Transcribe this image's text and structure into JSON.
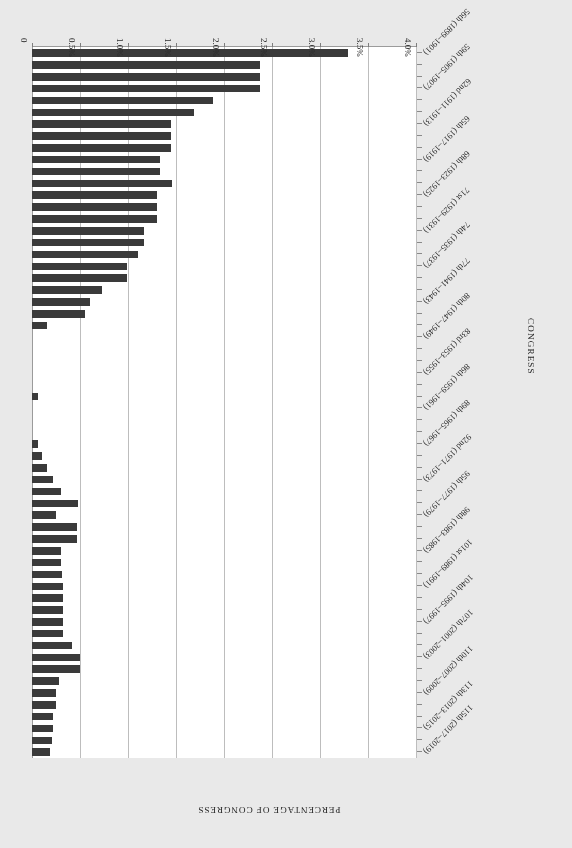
{
  "chart_data": {
    "type": "bar",
    "orientation": "horizontal",
    "title": "",
    "xlabel": "PERCENTAGE OF CONGRESS",
    "ylabel": "CONGRESS",
    "grid": true,
    "legend": false,
    "rotated_180": true,
    "xlim": [
      0,
      4.0
    ],
    "xticks": [
      0,
      0.5,
      1.0,
      1.5,
      2.0,
      2.5,
      3.0,
      3.5,
      4.0
    ],
    "xtick_labels": [
      "0",
      "0.5%",
      "1.0%",
      "1.5%",
      "2.0%",
      "2.5%",
      "3.0%",
      "3.5%",
      "4.0%"
    ],
    "value_suffix": "%",
    "bar_color": "#3a3a3a",
    "plot_background": "#ffffff",
    "page_background": "#e9e9e9",
    "categories": [
      "56th (1899–1901)",
      "57th (1901–1903)",
      "58th (1903–1905)",
      "59th (1905–1907)",
      "60th (1907–1909)",
      "61st (1909–1911)",
      "62nd (1911–1913)",
      "63rd (1913–1915)",
      "64th (1915–1917)",
      "65th (1917–1919)",
      "66th (1919–1921)",
      "67th (1921–1923)",
      "68th (1923–1925)",
      "69th (1925–1927)",
      "70th (1927–1929)",
      "71st (1929–1931)",
      "72nd (1931–1933)",
      "73rd (1933–1935)",
      "74th (1935–1937)",
      "75th (1937–1939)",
      "76th (1939–1941)",
      "77th (1941–1943)",
      "78th (1943–1945)",
      "79th (1945–1947)",
      "80th (1947–1949)",
      "81st (1949–1951)",
      "82nd (1951–1953)",
      "83rd (1953–1955)",
      "84th (1955–1957)",
      "85th (1957–1959)",
      "86th (1959–1961)",
      "87th (1961–1963)",
      "88th (1963–1965)",
      "89th (1965–1967)",
      "90th (1967–1969)",
      "91st (1969–1971)",
      "92nd (1971–1973)",
      "93rd (1973–1975)",
      "94th (1975–1977)",
      "95th (1977–1979)",
      "96th (1979–1981)",
      "97th (1981–1983)",
      "98th (1983–1985)",
      "99th (1985–1987)",
      "100th (1987–1989)",
      "101st (1989–1991)",
      "102nd (1991–1993)",
      "103rd (1993–1995)",
      "104th (1995–1997)",
      "105th (1997–1999)",
      "106th (1999–2001)",
      "107th (2001–2003)",
      "108th (2003–2005)",
      "109th (2005–2007)",
      "110th (2007–2009)",
      "111th (2009–2011)",
      "112th (2011–2013)",
      "113th (2013–2015)",
      "114th (2015–2017)",
      "115th (2017–2019)"
    ],
    "labeled_categories": [
      "56th (1899–1901)",
      "59th (1905–1907)",
      "62nd (1911–1913)",
      "65th (1917–1919)",
      "68th (1923–1925)",
      "71st (1929–1931)",
      "74th (1935–1937)",
      "77th (1941–1943)",
      "80th (1947–1949)",
      "83rd (1953–1955)",
      "86th (1959–1961)",
      "89th (1965–1967)",
      "92nd (1971–1973)",
      "95th (1977–1979)",
      "98th (1983–1985)",
      "101st (1989–1991)",
      "104th (1995–1997)",
      "107th (2001–2003)",
      "110th (2007–2009)",
      "113th (2013–2015)",
      "115th (2017–2019)"
    ],
    "values": [
      0.19,
      0.21,
      0.22,
      0.22,
      0.25,
      0.25,
      0.28,
      0.5,
      0.5,
      0.42,
      0.32,
      0.32,
      0.32,
      0.32,
      0.32,
      0.31,
      0.3,
      0.3,
      0.47,
      0.47,
      0.25,
      0.48,
      0.3,
      0.22,
      0.16,
      0.1,
      0.06,
      0.0,
      0.0,
      0.0,
      0.06,
      0.0,
      0.0,
      0.0,
      0.0,
      0.0,
      0.16,
      0.55,
      0.6,
      0.73,
      0.99,
      0.99,
      1.1,
      1.17,
      1.17,
      1.3,
      1.3,
      1.3,
      1.46,
      1.33,
      1.33,
      1.45,
      1.45,
      1.45,
      1.69,
      1.89,
      2.38,
      2.38,
      2.38,
      2.55
    ],
    "top_value": 3.29,
    "top_value_category": "115th (2017–2019)",
    "note": "Percentage of Congress by congress number, 56th through 115th"
  },
  "axes": {
    "value_axis_title": "PERCENTAGE OF CONGRESS",
    "category_axis_title": "CONGRESS"
  }
}
